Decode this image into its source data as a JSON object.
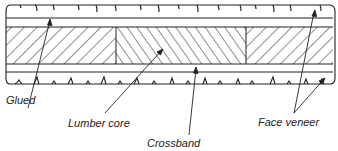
{
  "diagram": {
    "layers": [
      {
        "name": "Face veneer (top)",
        "y0": 5,
        "y1": 18
      },
      {
        "name": "Crossband (top)",
        "y0": 18,
        "y1": 27
      },
      {
        "name": "Lumber core",
        "y0": 27,
        "y1": 64
      },
      {
        "name": "Crossband (bottom)",
        "y0": 64,
        "y1": 72
      },
      {
        "name": "Face veneer (bottom)",
        "y0": 72,
        "y1": 84
      }
    ],
    "core_blocks": [
      {
        "x0": 6,
        "x1": 116,
        "hatch": "back"
      },
      {
        "x0": 116,
        "x1": 246,
        "hatch": "forward"
      },
      {
        "x0": 246,
        "x1": 333,
        "hatch": "back"
      }
    ],
    "labels": {
      "glued": "Glued",
      "lumber_core": "Lumber core",
      "crossband": "Crossband",
      "face_veneer": "Face veneer"
    },
    "colors": {
      "line": "#222222",
      "background": "#ffffff"
    }
  }
}
